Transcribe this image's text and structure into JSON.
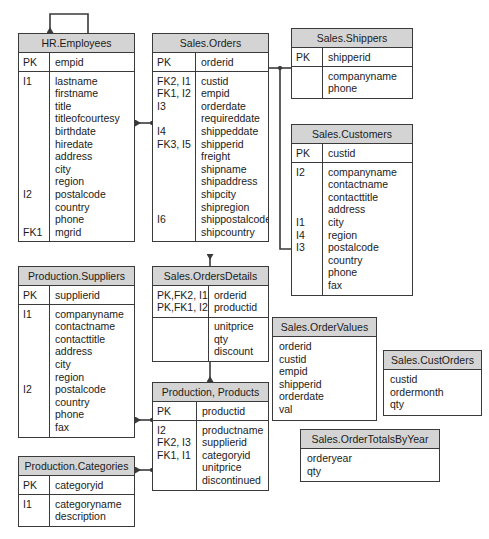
{
  "diagram": {
    "style": {
      "header_fill": "#d4d4d4",
      "border_color": "#3a3a3a",
      "text_color": "#1b1b1b",
      "background": "#ffffff",
      "line_color": "#3a3a3a"
    }
  },
  "entities": [
    {
      "id": "hr-employees",
      "name": "HR.Employees",
      "kind": "table",
      "x": 18,
      "y": 33,
      "w": 117,
      "key_col_w": 31,
      "sections": [
        {
          "keys": "PK",
          "attrs": "empid"
        },
        {
          "keys": "I1\n\n\n\n\n\n\n\n\nI2\n\n\nFK1",
          "attrs": "lastname\nfirstname\ntitle\ntitleofcourtesy\nbirthdate\nhiredate\naddress\ncity\nregion\npostalcode\ncountry\nphone\nmgrid"
        }
      ]
    },
    {
      "id": "sales-orders",
      "name": "Sales.Orders",
      "kind": "table",
      "x": 152,
      "y": 33,
      "w": 117,
      "key_col_w": 43,
      "sections": [
        {
          "keys": "PK",
          "attrs": "orderid"
        },
        {
          "keys": "FK2, I1\nFK1, I2\nI3\n\nI4\nFK3, I5\n\n\n\n\n\nI6",
          "attrs": "custid\nempid\norderdate\nrequireddate\nshippeddate\nshipperid\nfreight\nshipname\nshipaddress\nshipcity\nshipregion\nshippostalcode\nshipcountry"
        }
      ]
    },
    {
      "id": "sales-shippers",
      "name": "Sales.Shippers",
      "kind": "table",
      "x": 291,
      "y": 28,
      "w": 122,
      "key_col_w": 31,
      "sections": [
        {
          "keys": "PK",
          "attrs": "shipperid"
        },
        {
          "keys": "",
          "attrs": "companyname\nphone"
        }
      ]
    },
    {
      "id": "sales-customers",
      "name": "Sales.Customers",
      "kind": "table",
      "x": 291,
      "y": 124,
      "w": 122,
      "key_col_w": 31,
      "sections": [
        {
          "keys": "PK",
          "attrs": "custid"
        },
        {
          "keys": "I2\n\n\n\nI1\nI4\nI3",
          "attrs": "companyname\ncontactname\ncontacttitle\naddress\ncity\nregion\npostalcode\ncountry\nphone\nfax"
        }
      ]
    },
    {
      "id": "production-suppliers",
      "name": "Production.Suppliers",
      "kind": "table",
      "x": 18,
      "y": 266,
      "w": 117,
      "key_col_w": 31,
      "sections": [
        {
          "keys": "PK",
          "attrs": "supplierid"
        },
        {
          "keys": "I1\n\n\n\n\n\nI2",
          "attrs": "companyname\ncontactname\ncontacttitle\naddress\ncity\nregion\npostalcode\ncountry\nphone\nfax"
        }
      ]
    },
    {
      "id": "sales-ordersdetails",
      "name": "Sales.OrdersDetails",
      "kind": "table",
      "x": 152,
      "y": 266,
      "w": 117,
      "key_col_w": 56,
      "sections": [
        {
          "keys": "PK,FK2, I1\nPK,FK1, I2",
          "attrs": "orderid\nproductid"
        },
        {
          "keys": "",
          "attrs": "unitprice\nqty\ndiscount"
        }
      ]
    },
    {
      "id": "production-products",
      "name": "Production, Products",
      "kind": "table",
      "x": 152,
      "y": 382,
      "w": 117,
      "key_col_w": 44,
      "sections": [
        {
          "keys": "PK",
          "attrs": "productid"
        },
        {
          "keys": "I2\nFK2, I3\nFK1, I1",
          "attrs": "productname\nsupplierid\ncategoryid\nunitprice\ndiscontinued"
        }
      ]
    },
    {
      "id": "production-categories",
      "name": "Production.Categories",
      "kind": "table",
      "x": 18,
      "y": 456,
      "w": 117,
      "key_col_w": 31,
      "sections": [
        {
          "keys": "PK",
          "attrs": "categoryid"
        },
        {
          "keys": "I1",
          "attrs": "categoryname\ndescription"
        }
      ]
    },
    {
      "id": "sales-ordervalues",
      "name": "Sales.OrderValues",
      "kind": "view",
      "x": 272,
      "y": 317,
      "w": 105,
      "body": "orderid\ncustid\nempid\nshipperid\norderdate\nval"
    },
    {
      "id": "sales-custorders",
      "name": "Sales.CustOrders",
      "kind": "view",
      "x": 383,
      "y": 350,
      "w": 99,
      "body": "custid\nordermonth\nqty"
    },
    {
      "id": "sales-ordertotalsbyyear",
      "name": "Sales.OrderTotalsByYear",
      "kind": "view",
      "x": 300,
      "y": 429,
      "w": 140,
      "body": "orderyear\nqty"
    }
  ],
  "relationships": [
    {
      "id": "rel-employees-self",
      "from": "hr-employees",
      "to": "hr-employees",
      "label": "mgrid self reference"
    },
    {
      "id": "rel-orders-employees",
      "from": "sales-orders",
      "to": "hr-employees",
      "label": "empid"
    },
    {
      "id": "rel-orders-shippers",
      "from": "sales-orders",
      "to": "sales-shippers",
      "label": "shipperid"
    },
    {
      "id": "rel-orders-customers",
      "from": "sales-orders",
      "to": "sales-customers",
      "label": "custid"
    },
    {
      "id": "rel-ordersdetails-orders",
      "from": "sales-ordersdetails",
      "to": "sales-orders",
      "label": "orderid"
    },
    {
      "id": "rel-ordersdetails-products",
      "from": "sales-ordersdetails",
      "to": "production-products",
      "label": "productid"
    },
    {
      "id": "rel-products-suppliers",
      "from": "production-products",
      "to": "production-suppliers",
      "label": "supplierid"
    },
    {
      "id": "rel-products-categories",
      "from": "production-products",
      "to": "production-categories",
      "label": "categoryid"
    }
  ]
}
